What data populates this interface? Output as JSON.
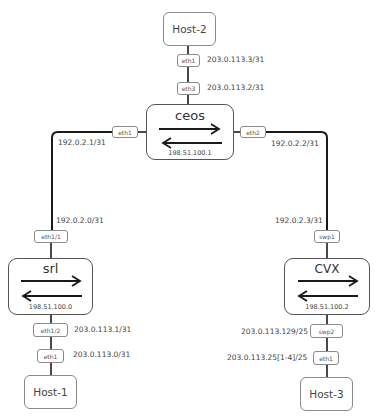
{
  "nodes": {
    "host2": {
      "label": "Host-2",
      "iface": "eth1",
      "ip": "203.0.113.3/31"
    },
    "host1": {
      "label": "Host-1",
      "iface": "eth1",
      "ip": "203.0.113.0/31"
    },
    "host3": {
      "label": "Host-3",
      "iface": "eth1",
      "ip": "203.0.113.25[1-4]/25"
    },
    "ceos": {
      "label": "ceos",
      "loopback": "198.51.100.1",
      "iface_top": "eth3",
      "ip_top": "203.0.113.2/31",
      "iface_left": "eth1",
      "ip_left": "192.0.2.1/31",
      "iface_right": "eth2",
      "ip_right": "192.0.2.2/31"
    },
    "srl": {
      "label": "srl",
      "loopback": "198.51.100.0",
      "iface_top": "eth1/1",
      "ip_top": "192.0.2.0/31",
      "iface_bottom": "eth1/2",
      "ip_bottom": "203.0.113.1/31"
    },
    "cvx": {
      "label": "cvx",
      "loopback": "198.51.100.2",
      "iface_top": "swp1",
      "ip_top": "192.0.2.3/31",
      "iface_bottom": "swp2",
      "ip_bottom": "203.0.113.129/25"
    }
  },
  "colors": {
    "line": "#1a1a1a",
    "box_border": "#8a8a8a",
    "text": "#444444"
  }
}
